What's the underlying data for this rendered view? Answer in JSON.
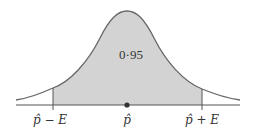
{
  "figure": {
    "type": "normal-distribution-confidence-interval",
    "shaded_area_label": "0·95",
    "axis_labels": {
      "left": "p̂ − E",
      "center": "p̂",
      "right": "p̂ + E"
    },
    "colors": {
      "shade": "#d3d3d3",
      "curve": "#666666",
      "axis": "#555555",
      "point": "#333333"
    }
  }
}
